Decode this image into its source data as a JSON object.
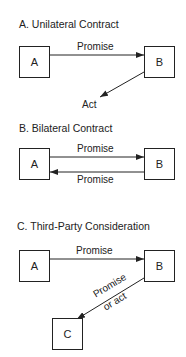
{
  "sections": [
    {
      "title": "A. Unilateral Contract",
      "nodes": [
        "A",
        "B"
      ],
      "edges": [
        {
          "from": "A",
          "to": "B",
          "label": "Promise"
        },
        {
          "from": "B",
          "to": "Act",
          "label": "Act"
        }
      ]
    },
    {
      "title": "B. Bilateral Contract",
      "nodes": [
        "A",
        "B"
      ],
      "edges": [
        {
          "from": "A",
          "to": "B",
          "label": "Promise"
        },
        {
          "from": "B",
          "to": "A",
          "label": "Promise"
        }
      ]
    },
    {
      "title": "C. Third-Party Consideration",
      "nodes": [
        "A",
        "B",
        "C"
      ],
      "edges": [
        {
          "from": "A",
          "to": "B",
          "label": "Promise"
        },
        {
          "from": "B",
          "to": "C",
          "label_line1": "Promise",
          "label_line2": "or act"
        }
      ]
    }
  ]
}
